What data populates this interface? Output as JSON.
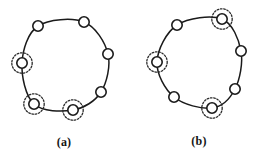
{
  "figure": {
    "width": 258,
    "height": 158,
    "background_color": "#ffffff",
    "stroke_color": "#1a1a1a",
    "node_fill_color": "#ffffff",
    "halo_color": "#2a2a2a",
    "halo_style": "dotted"
  },
  "chart_data": {
    "type": "diagram",
    "title": "",
    "subtitle": "",
    "panels": [
      {
        "id": "a",
        "label": "(a)",
        "label_x": 64,
        "label_y": 143,
        "ring": {
          "cx": 64,
          "cy": 66,
          "rx": 44,
          "ry": 44
        },
        "node_radius": 5.2,
        "halo_radius": 10.2,
        "node_count": 7,
        "highlighted_count": 3,
        "nodes": [
          {
            "id": "a1",
            "x": 38,
            "y": 26,
            "highlighted": false
          },
          {
            "id": "a2",
            "x": 84,
            "y": 22,
            "highlighted": false
          },
          {
            "id": "a3",
            "x": 108,
            "y": 54,
            "highlighted": false
          },
          {
            "id": "a4",
            "x": 101,
            "y": 92,
            "highlighted": false
          },
          {
            "id": "a5",
            "x": 73,
            "y": 110,
            "highlighted": true
          },
          {
            "id": "a6",
            "x": 34,
            "y": 104,
            "highlighted": true
          },
          {
            "id": "a7",
            "x": 22,
            "y": 63,
            "highlighted": true
          }
        ]
      },
      {
        "id": "b",
        "label": "(b)",
        "label_x": 199,
        "label_y": 142,
        "ring": {
          "cx": 199,
          "cy": 62,
          "rx": 43,
          "ry": 43
        },
        "node_radius": 5.2,
        "halo_radius": 10.2,
        "node_count": 7,
        "highlighted_count": 3,
        "nodes": [
          {
            "id": "b1",
            "x": 177,
            "y": 25,
            "highlighted": false
          },
          {
            "id": "b2",
            "x": 222,
            "y": 19,
            "highlighted": true
          },
          {
            "id": "b3",
            "x": 241,
            "y": 51,
            "highlighted": false
          },
          {
            "id": "b4",
            "x": 235,
            "y": 89,
            "highlighted": false
          },
          {
            "id": "b5",
            "x": 212,
            "y": 108,
            "highlighted": true
          },
          {
            "id": "b6",
            "x": 174,
            "y": 97,
            "highlighted": false
          },
          {
            "id": "b7",
            "x": 157,
            "y": 62,
            "highlighted": true
          }
        ]
      }
    ]
  }
}
